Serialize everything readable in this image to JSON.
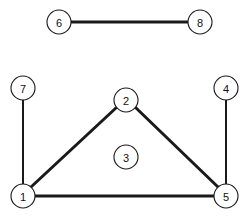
{
  "diagram": {
    "background_color": "#ffffff",
    "stroke_color": "#1a1a1a",
    "node_fill_color": "#ffffff",
    "label_color": "#111111",
    "canvas": {
      "width": 251,
      "height": 217
    },
    "node_radius": 12,
    "nodes": [
      {
        "id": "1",
        "label": "1",
        "x": 23,
        "y": 196
      },
      {
        "id": "2",
        "label": "2",
        "x": 126,
        "y": 100
      },
      {
        "id": "3",
        "label": "3",
        "x": 126,
        "y": 157
      },
      {
        "id": "4",
        "label": "4",
        "x": 226,
        "y": 88
      },
      {
        "id": "5",
        "label": "5",
        "x": 226,
        "y": 196
      },
      {
        "id": "6",
        "label": "6",
        "x": 59,
        "y": 22
      },
      {
        "id": "7",
        "label": "7",
        "x": 23,
        "y": 88
      },
      {
        "id": "8",
        "label": "8",
        "x": 200,
        "y": 22
      }
    ],
    "edges": [
      {
        "id": "edge-6-8",
        "from": "6",
        "to": "8",
        "weight": "thick",
        "x1": 71,
        "y1": 22,
        "x2": 188,
        "y2": 22
      },
      {
        "id": "edge-7-1",
        "from": "7",
        "to": "1",
        "weight": "thin",
        "x1": 23,
        "y1": 100,
        "x2": 23,
        "y2": 184
      },
      {
        "id": "edge-4-5",
        "from": "4",
        "to": "5",
        "weight": "thin",
        "x1": 226,
        "y1": 100,
        "x2": 226,
        "y2": 184
      },
      {
        "id": "edge-1-2",
        "from": "1",
        "to": "2",
        "weight": "thick",
        "x1": 31,
        "y1": 187,
        "x2": 117,
        "y2": 107
      },
      {
        "id": "edge-2-5",
        "from": "2",
        "to": "5",
        "weight": "thick",
        "x1": 135,
        "y1": 107,
        "x2": 218,
        "y2": 187
      },
      {
        "id": "edge-1-5",
        "from": "1",
        "to": "5",
        "weight": "thick",
        "x1": 35,
        "y1": 196,
        "x2": 214,
        "y2": 196
      }
    ]
  }
}
